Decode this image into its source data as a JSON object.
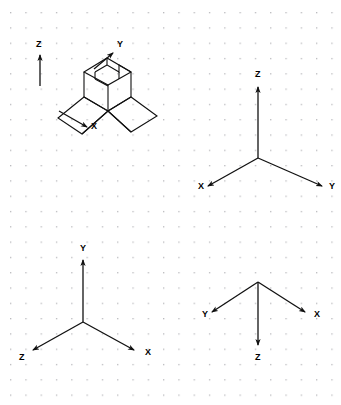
{
  "canvas": {
    "width": 341,
    "height": 405,
    "background_color": "#ffffff",
    "grid": {
      "type": "dot-grid",
      "spacing_px": 15.3,
      "dot_color": "#b9b9bd",
      "dot_size_px": 1.2,
      "origin_x": 10,
      "origin_y": 12
    },
    "line_color": "#111111"
  },
  "figures": [
    {
      "id": "figure-isometric-solid",
      "name": "isometric-solid-with-axes",
      "type": "pictorial-3d-object",
      "description": "Isometric view of a notched block resting on a flared base with three labeled coordinate arrows",
      "axes": [
        {
          "label": "Z",
          "label_x": 36,
          "label_y": 43,
          "direction": "up",
          "tail_x": 40,
          "tail_y": 86,
          "head_x": 40,
          "head_y": 53
        },
        {
          "label": "Y",
          "label_x": 117,
          "label_y": 43,
          "direction": "up-right",
          "tail_x": 95,
          "tail_y": 68,
          "head_x": 114,
          "head_y": 52
        },
        {
          "label": "X",
          "label_x": 91,
          "label_y": 126,
          "direction": "down-right",
          "tail_x": 59,
          "tail_y": 111,
          "head_x": 88,
          "head_y": 128
        }
      ],
      "solid_outline": [
        "M 85 70 L 107 57 L 132 71 L 132 96 L 108 110 L 85 96 Z",
        "M 85 70 L 108 83 L 132 71",
        "M 108 83 L 108 110",
        "M 107 57 L 107 70 L 120 78 L 120 64",
        "M 107 70 L 94 63",
        "M 94 63 L 94 77",
        "M 120 78 L 132 71",
        "M 57 117 L 85 96 L 108 110 L 82 133 Z",
        "M 108 110 L 132 96 L 156 115 L 131 131 Z",
        "M 57 117 L 82 133 L 108 110",
        "M 82 133 L 131 131",
        "M 85 70 L 85 96",
        "M 132 71 L 132 96"
      ]
    },
    {
      "id": "figure-axes-top-right",
      "name": "axis-triad-z-up",
      "type": "coordinate-triad",
      "vertex_x": 258,
      "vertex_y": 158,
      "axes": [
        {
          "label": "Z",
          "label_x": 255,
          "label_y": 72,
          "direction": "up",
          "head_x": 258,
          "head_y": 85
        },
        {
          "label": "X",
          "label_x": 198,
          "label_y": 184,
          "direction": "down-left",
          "head_x": 206,
          "head_y": 187
        },
        {
          "label": "Y",
          "label_x": 330,
          "label_y": 184,
          "direction": "down-right",
          "head_x": 324,
          "head_y": 187
        }
      ]
    },
    {
      "id": "figure-axes-bottom-left",
      "name": "axis-triad-y-up",
      "type": "coordinate-triad",
      "vertex_x": 83,
      "vertex_y": 322,
      "axes": [
        {
          "label": "Y",
          "label_x": 80,
          "label_y": 246,
          "direction": "up",
          "head_x": 83,
          "head_y": 258
        },
        {
          "label": "Z",
          "label_x": 19,
          "label_y": 355,
          "direction": "down-left",
          "head_x": 31,
          "head_y": 351
        },
        {
          "label": "X",
          "label_x": 146,
          "label_y": 350,
          "direction": "down-right",
          "head_x": 136,
          "head_y": 351
        }
      ]
    },
    {
      "id": "figure-axes-bottom-right",
      "name": "axis-triad-z-down",
      "type": "coordinate-triad",
      "vertex_x": 258,
      "vertex_y": 282,
      "axes": [
        {
          "label": "Y",
          "label_x": 202,
          "label_y": 314,
          "direction": "up-left",
          "head_x": 210,
          "head_y": 313
        },
        {
          "label": "X",
          "label_x": 314,
          "label_y": 314,
          "direction": "up-right",
          "head_x": 307,
          "head_y": 313
        },
        {
          "label": "Z",
          "label_x": 255,
          "label_y": 356,
          "direction": "down",
          "head_x": 258,
          "head_y": 347
        }
      ]
    }
  ]
}
